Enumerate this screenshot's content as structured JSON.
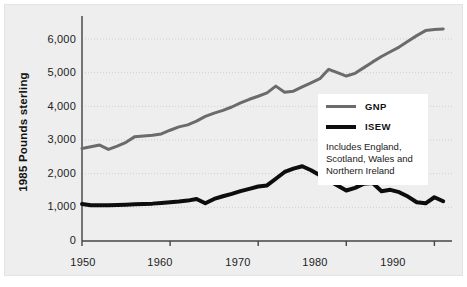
{
  "chart_data": {
    "type": "line",
    "title": "",
    "subtitle": "",
    "xlabel": "",
    "ylabel": "1985 Pounds sterling",
    "xlim": [
      1950,
      1992
    ],
    "ylim": [
      0,
      6500
    ],
    "grid": "horizontal-dotted",
    "legend_position": "right-middle",
    "xticks": [
      "1950",
      "1960",
      "1970",
      "1980",
      "1990"
    ],
    "xtick_values": [
      1950,
      1960,
      1970,
      1980,
      1990
    ],
    "yticks": [
      "0",
      "1,000",
      "2,000",
      "3,000",
      "4,000",
      "5,000",
      "6,000"
    ],
    "ytick_values": [
      0,
      1000,
      2000,
      3000,
      4000,
      5000,
      6000
    ],
    "x": [
      1950,
      1951,
      1952,
      1953,
      1954,
      1955,
      1956,
      1957,
      1958,
      1959,
      1960,
      1961,
      1962,
      1963,
      1964,
      1965,
      1966,
      1967,
      1968,
      1969,
      1970,
      1971,
      1972,
      1973,
      1974,
      1975,
      1976,
      1977,
      1978,
      1979,
      1980,
      1981,
      1982,
      1983,
      1984,
      1985,
      1986,
      1987,
      1988,
      1989,
      1990,
      1991
    ],
    "series": [
      {
        "name": "GNP",
        "color": "#6b6b6b",
        "width": 3,
        "values": [
          2750,
          2800,
          2850,
          2720,
          2820,
          2930,
          3100,
          3120,
          3140,
          3180,
          3290,
          3390,
          3450,
          3560,
          3700,
          3800,
          3880,
          3980,
          4100,
          4210,
          4300,
          4400,
          4600,
          4420,
          4450,
          4580,
          4700,
          4820,
          5100,
          5000,
          4900,
          4980,
          5150,
          5320,
          5480,
          5620,
          5760,
          5930,
          6100,
          6250,
          6280,
          6300
        ]
      },
      {
        "name": "ISEW",
        "color": "#0d0d0d",
        "width": 4,
        "values": [
          1100,
          1060,
          1060,
          1060,
          1070,
          1080,
          1090,
          1100,
          1110,
          1130,
          1150,
          1170,
          1200,
          1250,
          1120,
          1250,
          1330,
          1400,
          1480,
          1550,
          1620,
          1650,
          1850,
          2050,
          2150,
          2220,
          2100,
          1950,
          1800,
          1650,
          1500,
          1580,
          1700,
          1720,
          1480,
          1520,
          1450,
          1320,
          1150,
          1120,
          1300,
          1180
        ]
      }
    ],
    "legend": {
      "entries": [
        {
          "label": "GNP",
          "color": "#6b6b6b"
        },
        {
          "label": "ISEW",
          "color": "#0d0d0d"
        }
      ],
      "note": "Includes England, Scotland, Wales and Northern Ireland"
    },
    "annotations": []
  },
  "axis": {
    "ylabel": "1985 Pounds sterling"
  },
  "legend": {
    "gnp_label": "GNP",
    "isew_label": "ISEW",
    "note": "Includes England, Scotland, Wales and Northern Ireland"
  },
  "yticks": {
    "t0": "0",
    "t1": "1,000",
    "t2": "2,000",
    "t3": "3,000",
    "t4": "4,000",
    "t5": "5,000",
    "t6": "6,000"
  },
  "xticks": {
    "t0": "1950",
    "t1": "1960",
    "t2": "1970",
    "t3": "1980",
    "t4": "1990"
  }
}
